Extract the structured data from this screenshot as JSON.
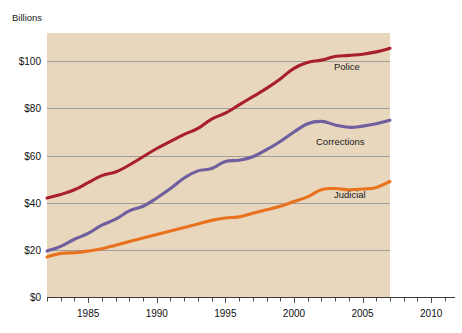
{
  "chart_data": {
    "type": "line",
    "title": "",
    "subtitle": "",
    "ylabel": "Billions",
    "xlabel": "",
    "xlim": [
      1982,
      2012
    ],
    "ylim": [
      0,
      112
    ],
    "grid": "horizontal",
    "legend_position": "inline-right",
    "y_ticks": [
      0,
      20,
      40,
      60,
      80,
      100
    ],
    "y_tick_labels": [
      "$0",
      "$20",
      "$40",
      "$60",
      "$80",
      "$100"
    ],
    "x_ticks": [
      1985,
      1990,
      1995,
      2000,
      2005,
      2010
    ],
    "x_tick_labels": [
      "1985",
      "1990",
      "1995",
      "2000",
      "2005",
      "2010"
    ],
    "x_minor_tick_step": 1,
    "x": [
      1982,
      1983,
      1984,
      1985,
      1986,
      1987,
      1988,
      1989,
      1990,
      1991,
      1992,
      1993,
      1994,
      1995,
      1996,
      1997,
      1998,
      1999,
      2000,
      2001,
      2002,
      2003,
      2004,
      2005,
      2006,
      2007
    ],
    "series": [
      {
        "name": "Police",
        "color": "#a8202e",
        "values": [
          42.0,
          43.5,
          45.5,
          48.5,
          51.5,
          53.0,
          56.0,
          59.5,
          63.0,
          66.0,
          69.0,
          71.5,
          75.5,
          78.0,
          81.5,
          85.0,
          88.5,
          92.5,
          97.0,
          99.5,
          100.5,
          102.0,
          102.5,
          103.0,
          104.0,
          105.5
        ]
      },
      {
        "name": "Corrections",
        "color": "#6f5f9e",
        "values": [
          19.5,
          21.5,
          24.5,
          27.0,
          30.5,
          33.0,
          36.5,
          38.5,
          42.0,
          46.0,
          50.5,
          53.5,
          54.5,
          57.5,
          58.0,
          59.5,
          62.5,
          66.0,
          70.0,
          73.5,
          74.5,
          73.0,
          72.0,
          72.5,
          73.5,
          75.0
        ]
      },
      {
        "name": "Judicial",
        "color": "#e8721e",
        "values": [
          17.0,
          18.5,
          18.8,
          19.5,
          20.5,
          22.0,
          23.5,
          25.0,
          26.5,
          28.0,
          29.5,
          31.0,
          32.5,
          33.5,
          34.0,
          35.5,
          37.0,
          38.5,
          40.5,
          42.5,
          45.5,
          46.0,
          45.5,
          45.8,
          46.5,
          49.0
        ]
      }
    ],
    "plot_background": "#e8d6bd",
    "page_background": "#ffffff"
  }
}
